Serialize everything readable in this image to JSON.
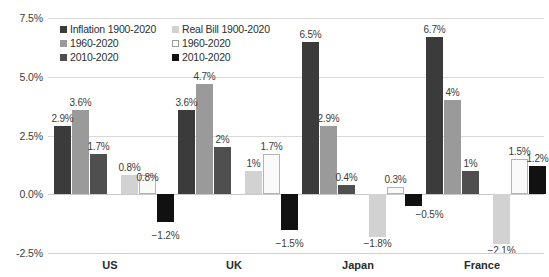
{
  "chart_data": {
    "type": "bar",
    "title": "",
    "subtitle": "",
    "xlabel": "",
    "ylabel": "",
    "categories": [
      "US",
      "UK",
      "Japan",
      "France"
    ],
    "ylim": [
      -2.5,
      7.5
    ],
    "ytick_labels": [
      "7.5%",
      "5.0%",
      "2.5%",
      "0.0%",
      "-2.5%"
    ],
    "ytick_values": [
      7.5,
      5.0,
      2.5,
      0.0,
      -2.5
    ],
    "grid": true,
    "legend_position": "top-left",
    "value_suffix": "%",
    "series": [
      {
        "name": "Inflation 1900-2020",
        "color": "#3b3b3b",
        "values": [
          2.9,
          3.6,
          6.5,
          6.7
        ],
        "labels": [
          "2.9%",
          "3.6%",
          "6.5%",
          "6.7%"
        ]
      },
      {
        "name": "1960-2020",
        "color": "#9a9a9a",
        "values": [
          3.6,
          4.7,
          2.9,
          4.0
        ],
        "labels": [
          "3.6%",
          "4.7%",
          "2.9%",
          "4%"
        ]
      },
      {
        "name": "2010-2020",
        "color": "#4f4f4f",
        "values": [
          1.7,
          2.0,
          0.4,
          1.0
        ],
        "labels": [
          "1.7%",
          "2%",
          "0.4%",
          "1%"
        ]
      },
      {
        "name": "Real Bill 1900-2020",
        "color": "#d2d2d2",
        "values": [
          0.8,
          1.0,
          -1.8,
          -2.1
        ],
        "labels": [
          "0.8%",
          "1%",
          "-1.8%",
          "-2.1%"
        ]
      },
      {
        "name": "1960-2020",
        "color": "#fafafa",
        "values": [
          0.8,
          1.7,
          0.3,
          1.5
        ],
        "labels": [
          "0.8%",
          "1.7%",
          "0.3%",
          "1.5%"
        ]
      },
      {
        "name": "2010-2020",
        "color": "#111111",
        "values": [
          -1.2,
          -1.5,
          -0.5,
          1.2
        ],
        "labels": [
          "-1.2%",
          "-1.5%",
          "-0.5%",
          "1.2%"
        ]
      }
    ]
  },
  "legend": {
    "entries": [
      {
        "label": "Inflation 1900-2020",
        "swatch_class": "s0"
      },
      {
        "label": "Real Bill 1900-2020",
        "swatch_class": "s3"
      },
      {
        "label": "1960-2020",
        "swatch_class": "s1"
      },
      {
        "label": "1960-2020",
        "swatch_class": "s4"
      },
      {
        "label": "2010-2020",
        "swatch_class": "s2"
      },
      {
        "label": "2010-2020",
        "swatch_class": "s5"
      }
    ]
  }
}
